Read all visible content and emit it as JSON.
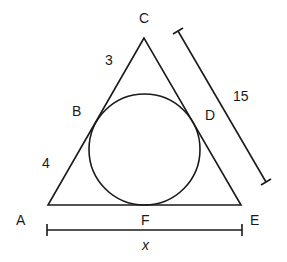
{
  "diagram": {
    "type": "geometry",
    "points": {
      "A": "A",
      "B": "B",
      "C": "C",
      "D": "D",
      "E": "E",
      "F": "F"
    },
    "segment_labels": {
      "CB": "3",
      "BA": "4",
      "CE": "15",
      "AE": "x"
    },
    "colors": {
      "stroke": "#1a1a1a",
      "background": "#ffffff"
    }
  }
}
